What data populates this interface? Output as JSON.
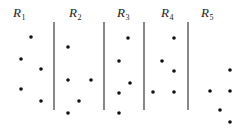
{
  "diagram": {
    "regions": [
      {
        "label": "R",
        "subscript": "1",
        "label_x": 13,
        "label_y": 17
      },
      {
        "label": "R",
        "subscript": "2",
        "label_x": 69,
        "label_y": 17
      },
      {
        "label": "R",
        "subscript": "3",
        "label_x": 117,
        "label_y": 17
      },
      {
        "label": "R",
        "subscript": "4",
        "label_x": 161,
        "label_y": 17
      },
      {
        "label": "R",
        "subscript": "5",
        "label_x": 201,
        "label_y": 17
      }
    ],
    "dividers": [
      {
        "x": 54,
        "y1": 22,
        "y2": 110
      },
      {
        "x": 104,
        "y1": 22,
        "y2": 110
      },
      {
        "x": 144,
        "y1": 22,
        "y2": 110
      },
      {
        "x": 188,
        "y1": 22,
        "y2": 110
      }
    ],
    "points": [
      {
        "region": 1,
        "x": 31,
        "y": 37
      },
      {
        "region": 1,
        "x": 21,
        "y": 59
      },
      {
        "region": 1,
        "x": 41,
        "y": 69
      },
      {
        "region": 1,
        "x": 21,
        "y": 89
      },
      {
        "region": 1,
        "x": 41,
        "y": 101
      },
      {
        "region": 2,
        "x": 68,
        "y": 47
      },
      {
        "region": 2,
        "x": 68,
        "y": 80
      },
      {
        "region": 2,
        "x": 91,
        "y": 80
      },
      {
        "region": 2,
        "x": 79,
        "y": 101
      },
      {
        "region": 2,
        "x": 68,
        "y": 113
      },
      {
        "region": 3,
        "x": 128,
        "y": 38
      },
      {
        "region": 3,
        "x": 119,
        "y": 61
      },
      {
        "region": 3,
        "x": 130,
        "y": 83
      },
      {
        "region": 3,
        "x": 119,
        "y": 93
      },
      {
        "region": 3,
        "x": 119,
        "y": 113
      },
      {
        "region": 4,
        "x": 174,
        "y": 38
      },
      {
        "region": 4,
        "x": 162,
        "y": 61
      },
      {
        "region": 4,
        "x": 174,
        "y": 71
      },
      {
        "region": 4,
        "x": 153,
        "y": 92
      },
      {
        "region": 4,
        "x": 174,
        "y": 92
      },
      {
        "region": 5,
        "x": 230,
        "y": 70
      },
      {
        "region": 5,
        "x": 210,
        "y": 91
      },
      {
        "region": 5,
        "x": 230,
        "y": 91
      },
      {
        "region": 5,
        "x": 220,
        "y": 110
      },
      {
        "region": 5,
        "x": 230,
        "y": 122
      }
    ],
    "colors": {
      "line": "#555555",
      "point": "#111111",
      "text": "#222222"
    }
  }
}
